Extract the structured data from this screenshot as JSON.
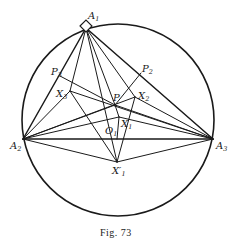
{
  "figure": {
    "caption": "Fig. 73",
    "circle": {
      "cx": 118,
      "cy": 120,
      "r": 96
    },
    "stroke_color": "#1a1a1a",
    "points": {
      "A1": {
        "x": 86,
        "y": 28,
        "label": "A",
        "sub": "1"
      },
      "A2": {
        "x": 23,
        "y": 139,
        "label": "A",
        "sub": "2"
      },
      "A3": {
        "x": 213,
        "y": 139,
        "label": "A",
        "sub": "3"
      },
      "P": {
        "x": 115,
        "y": 105,
        "label": "P",
        "sub": ""
      },
      "P2": {
        "x": 141,
        "y": 73,
        "label": "P",
        "sub": "2"
      },
      "P3": {
        "x": 60,
        "y": 76,
        "label": "P",
        "sub": "3"
      },
      "X1": {
        "x": 119,
        "y": 117,
        "label": "X",
        "sub": "1"
      },
      "X2": {
        "x": 135,
        "y": 97,
        "label": "X",
        "sub": "2"
      },
      "X3": {
        "x": 70,
        "y": 91,
        "label": "X",
        "sub": "3"
      },
      "X1p": {
        "x": 117,
        "y": 162,
        "label": "X′",
        "sub": "1"
      },
      "O1": {
        "x": 117,
        "y": 139,
        "label": "O",
        "sub": "1"
      }
    }
  }
}
